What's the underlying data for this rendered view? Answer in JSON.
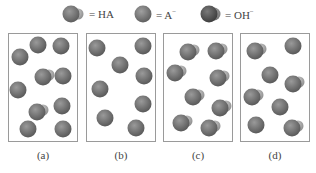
{
  "legend": {
    "items": [
      {
        "name": "HA",
        "symbol": "ha-molecule-icon",
        "label": "= HA"
      },
      {
        "name": "A-",
        "symbol": "a-minus-ion-icon",
        "label": "= A",
        "superscript": "−"
      },
      {
        "name": "OH-",
        "symbol": "hydroxide-ion-icon",
        "label": "= OH",
        "superscript": "−"
      }
    ]
  },
  "colors": {
    "sphere_main": "#6e6e6e",
    "sphere_highlight": "#9a9a9a",
    "bump_light": "#b5b5b5",
    "oh_dark": "#555555",
    "box_border": "#9a9a9a"
  },
  "panels": [
    {
      "label": "(a)",
      "particles": [
        {
          "type": "A-",
          "x": 38,
          "y": 45
        },
        {
          "type": "A-",
          "x": 61,
          "y": 46
        },
        {
          "type": "A-",
          "x": 20,
          "y": 57
        },
        {
          "type": "HA",
          "x": 43,
          "y": 77
        },
        {
          "type": "A-",
          "x": 63,
          "y": 76
        },
        {
          "type": "A-",
          "x": 18,
          "y": 90
        },
        {
          "type": "HA",
          "x": 37,
          "y": 112
        },
        {
          "type": "A-",
          "x": 62,
          "y": 106
        },
        {
          "type": "A-",
          "x": 28,
          "y": 129
        },
        {
          "type": "A-",
          "x": 63,
          "y": 129
        }
      ]
    },
    {
      "label": "(b)",
      "particles": [
        {
          "type": "A-",
          "x": 97,
          "y": 48
        },
        {
          "type": "A-",
          "x": 143,
          "y": 46
        },
        {
          "type": "A-",
          "x": 120,
          "y": 65
        },
        {
          "type": "A-",
          "x": 144,
          "y": 76
        },
        {
          "type": "A-",
          "x": 100,
          "y": 89
        },
        {
          "type": "A-",
          "x": 143,
          "y": 104
        },
        {
          "type": "A-",
          "x": 105,
          "y": 118
        },
        {
          "type": "A-",
          "x": 136,
          "y": 128
        }
      ]
    },
    {
      "label": "(c)",
      "particles": [
        {
          "type": "HA",
          "x": 188,
          "y": 52
        },
        {
          "type": "HA",
          "x": 216,
          "y": 51
        },
        {
          "type": "HA",
          "x": 175,
          "y": 73
        },
        {
          "type": "HA",
          "x": 218,
          "y": 78
        },
        {
          "type": "HA",
          "x": 193,
          "y": 97
        },
        {
          "type": "HA",
          "x": 220,
          "y": 108
        },
        {
          "type": "HA",
          "x": 181,
          "y": 123
        },
        {
          "type": "HA",
          "x": 209,
          "y": 128
        }
      ]
    },
    {
      "label": "(d)",
      "particles": [
        {
          "type": "HA",
          "x": 255,
          "y": 51
        },
        {
          "type": "A-",
          "x": 293,
          "y": 46
        },
        {
          "type": "A-",
          "x": 270,
          "y": 75
        },
        {
          "type": "HA",
          "x": 293,
          "y": 84
        },
        {
          "type": "HA",
          "x": 252,
          "y": 97
        },
        {
          "type": "A-",
          "x": 280,
          "y": 107
        },
        {
          "type": "A-",
          "x": 256,
          "y": 125
        },
        {
          "type": "HA",
          "x": 292,
          "y": 128
        }
      ]
    }
  ]
}
